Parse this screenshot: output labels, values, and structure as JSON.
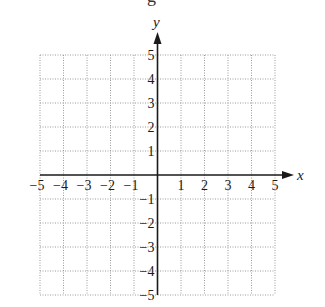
{
  "header": {
    "cut_off_text": "g"
  },
  "chart_data": {
    "type": "scatter",
    "title": "",
    "xlabel": "x",
    "ylabel": "y",
    "xlim": [
      -5,
      5
    ],
    "ylim": [
      -5,
      5
    ],
    "grid": true,
    "grid_style": "dotted",
    "x_ticks": [
      -5,
      -4,
      -3,
      -2,
      -1,
      1,
      2,
      3,
      4,
      5
    ],
    "y_ticks": [
      5,
      4,
      3,
      2,
      1,
      -1,
      -2,
      -3,
      -4,
      -5
    ],
    "x_tick_labels": [
      "−5",
      "−4",
      "−3",
      "−2",
      "−1",
      "1",
      "2",
      "3",
      "4",
      "5"
    ],
    "y_tick_labels": [
      "5",
      "4",
      "3",
      "2",
      "1",
      "−1",
      "−2",
      "−3",
      "−4",
      "−5"
    ],
    "points": [],
    "colors": {
      "axis": "#1a1a1a",
      "grid": "#9a9a9a"
    }
  }
}
